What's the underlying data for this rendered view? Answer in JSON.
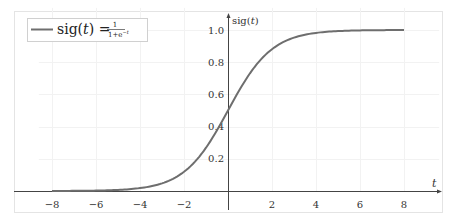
{
  "chart_data": {
    "type": "line",
    "title": "",
    "xlabel": "t",
    "ylabel": "sig(t)",
    "xlim": [
      -8.6,
      9.6
    ],
    "ylim": [
      0,
      1.1
    ],
    "x_ticks": [
      -8,
      -6,
      -4,
      -2,
      2,
      4,
      6,
      8
    ],
    "x_tick_labels": [
      "−8",
      "−6",
      "−4",
      "−2",
      "2",
      "4",
      "6",
      "8"
    ],
    "y_ticks": [
      0.2,
      0.4,
      0.6,
      0.8,
      1.0
    ],
    "y_tick_labels": [
      "0.2",
      "0.4",
      "0.6",
      "0.8",
      "1.0"
    ],
    "grid": true,
    "legend_position": "upper-left",
    "series": [
      {
        "name": "sig(t) = 1/(1+e^−t)",
        "color": "#6e6e6e",
        "function": "1/(1+exp(-t))",
        "x": [
          -8,
          -6,
          -4,
          -2,
          -1,
          0,
          1,
          2,
          4,
          6,
          8
        ],
        "values": [
          0.0003,
          0.0025,
          0.018,
          0.119,
          0.269,
          0.5,
          0.731,
          0.881,
          0.982,
          0.9975,
          0.9997
        ]
      }
    ]
  },
  "legend": {
    "lhs": "sig(t) =",
    "numerator": "1",
    "denominator": "1+e",
    "exponent": "−t"
  },
  "axes": {
    "x_label": "t",
    "y_label": "sig(t)"
  }
}
